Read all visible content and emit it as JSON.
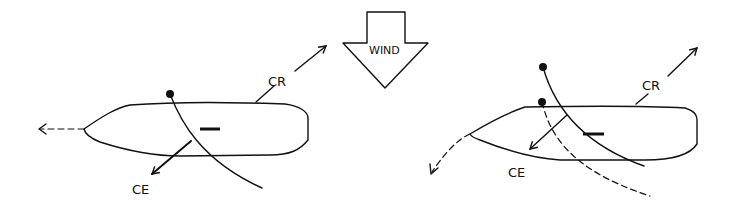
{
  "diagram": {
    "wind_arrow": {
      "label": "WIND",
      "direction": "down"
    },
    "left_boat": {
      "labels": {
        "resistance": "CR",
        "effort": "CE"
      },
      "heading": "left",
      "description": "Boat with centre of effort and centre of resistance aligned; travels straight"
    },
    "right_boat": {
      "labels": {
        "resistance": "CR",
        "effort": "CE"
      },
      "heading": "curving left/down",
      "description": "Boat with centre of effort forward of centre of resistance; dashed sail shows previous position and curving dashed arrow shows turning"
    },
    "colors": {
      "ink": "#111111",
      "background": "#ffffff"
    }
  }
}
